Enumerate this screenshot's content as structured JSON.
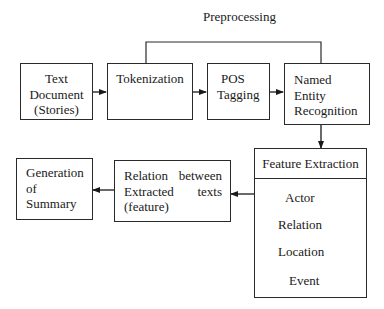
{
  "diagram": {
    "group_label": "Preprocessing",
    "nodes": {
      "text_document": {
        "lines": [
          "Text",
          "Document",
          "(Stories)"
        ]
      },
      "tokenization": {
        "lines": [
          "Tokenization"
        ]
      },
      "pos_tagging": {
        "lines": [
          "POS",
          "Tagging"
        ]
      },
      "ner": {
        "lines": [
          "Named",
          "Entity",
          "Recognition"
        ]
      },
      "feature_extraction": {
        "title": "Feature Extraction",
        "items": [
          "Actor",
          "Relation",
          "Location",
          "Event"
        ]
      },
      "relation_between": {
        "lines": [
          "Relation between",
          "Extracted texts",
          "(feature)"
        ],
        "words": [
          "Relation",
          "between",
          "Extracted",
          "texts",
          "(feature)"
        ]
      },
      "generation_summary": {
        "lines": [
          "Generation",
          "of",
          "Summary"
        ]
      }
    },
    "edges": [
      {
        "from": "Text Document (Stories)",
        "to": "Tokenization"
      },
      {
        "from": "Tokenization",
        "to": "POS Tagging"
      },
      {
        "from": "POS Tagging",
        "to": "Named Entity Recognition"
      },
      {
        "from": "Named Entity Recognition",
        "to": "Feature Extraction"
      },
      {
        "from": "Feature Extraction",
        "to": "Relation between Extracted texts (feature)"
      },
      {
        "from": "Relation between Extracted texts (feature)",
        "to": "Generation of Summary"
      }
    ],
    "colors": {
      "stroke": "#2a2a2a",
      "background": "#ffffff",
      "text": "#1a1a1a"
    }
  }
}
